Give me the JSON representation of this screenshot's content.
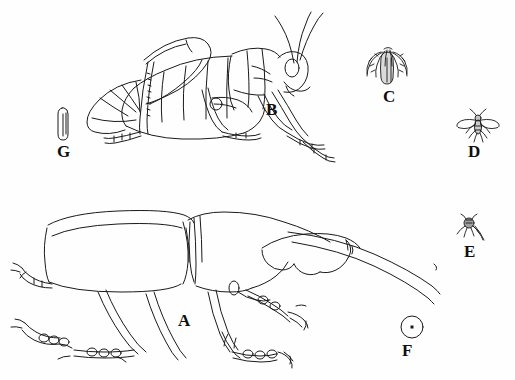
{
  "figure": {
    "background_color": "#fefefe",
    "ink_color": "#1a1a1a",
    "label_color": "#100f0f",
    "width": 515,
    "height": 380
  },
  "specimens": [
    {
      "label": "A",
      "name": "hercules-beetle",
      "description": "Large rhinoceros beetle in lateral view with long curved cephalic horn and toothed thoracic horn",
      "size_class": "largest",
      "label_x": 178,
      "label_y": 312
    },
    {
      "label": "B",
      "name": "grasshopper",
      "description": "Grasshopper in lateral view facing right with long antennae and enlarged hind femur",
      "size_class": "large",
      "label_x": 266,
      "label_y": 101
    },
    {
      "label": "C",
      "name": "plumed-insect",
      "description": "Small insect with drooping feathery plumes",
      "size_class": "small",
      "label_x": 383,
      "label_y": 88
    },
    {
      "label": "D",
      "name": "small-fly",
      "description": "Tiny fly with outstretched wings",
      "size_class": "tiny",
      "label_x": 468,
      "label_y": 143
    },
    {
      "label": "E",
      "name": "minute-insect",
      "description": "Minute dark insect with trailing appendage",
      "size_class": "minute",
      "label_x": 464,
      "label_y": 243
    },
    {
      "label": "F",
      "name": "circle-scale-marker",
      "description": "Small circle enclosing a central dot indicating a microscopic specimen",
      "size_class": "microscopic",
      "label_x": 402,
      "label_y": 342
    },
    {
      "label": "G",
      "name": "elongate-capsule-insect",
      "description": "Narrow elongate capsule-shaped specimen",
      "size_class": "slender",
      "label_x": 57,
      "label_y": 143
    }
  ]
}
